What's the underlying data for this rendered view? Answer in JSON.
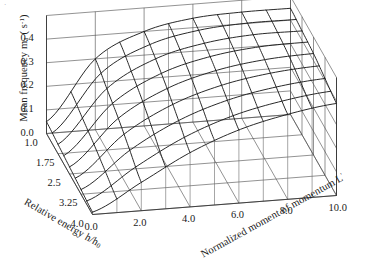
{
  "figure": {
    "type": "3d-surface-wireframe",
    "background": "#ffffff",
    "line_color": "#2b2b2b",
    "grid_color": "#4a4a4a"
  },
  "axes": {
    "z": {
      "label_prefix": "Mean frequency m",
      "label_sub": "1",
      "label_mid": " ( s",
      "label_sup": "-1",
      "label_suffix": ")",
      "full_label": "Mean frequency m1 ( s-1)",
      "ticks": [
        "0.0",
        "0.1",
        "0.2",
        "0.3",
        "0.4"
      ],
      "values": [
        0.0,
        0.1,
        0.2,
        0.3,
        0.4
      ],
      "range": [
        0.0,
        0.5
      ]
    },
    "x": {
      "label_prefix": "Relative energy h/h",
      "label_sub": "0",
      "full_label": "Relative energy h/h0",
      "ticks": [
        "1.0",
        "1.75",
        "2.5",
        "3.25",
        "4.0"
      ],
      "values": [
        1.0,
        1.75,
        2.5,
        3.25,
        4.0
      ],
      "range": [
        1.0,
        4.0
      ]
    },
    "y": {
      "label_prefix": "Normalized moment of momentum L",
      "label_sup": "'",
      "full_label": "Normalized moment of momentum L'",
      "ticks": [
        "0.0",
        "2.0",
        "4.0",
        "6.0",
        "8.0",
        "10.0"
      ],
      "values": [
        0.0,
        2.0,
        4.0,
        6.0,
        8.0,
        10.0
      ],
      "range": [
        0.0,
        10.0
      ]
    }
  },
  "chart_data": {
    "type": "surface",
    "title": "",
    "xlabel": "Relative energy h/h0",
    "ylabel": "Normalized moment of momentum L'",
    "zlabel": "Mean frequency m1 ( s-1)",
    "xlim": [
      1.0,
      4.0
    ],
    "ylim": [
      0.0,
      10.0
    ],
    "zlim": [
      0.0,
      0.5
    ],
    "grid": true,
    "legend": "none",
    "x": [
      1.0,
      1.75,
      2.5,
      3.25,
      4.0
    ],
    "y": [
      0.0,
      2.0,
      4.0,
      6.0,
      8.0,
      10.0
    ],
    "z_rows_note": "rows indexed by x (Relative energy h/h0), columns by y (Normalized moment of momentum L')",
    "z": [
      [
        0.05,
        0.3,
        0.4,
        0.44,
        0.45,
        0.45
      ],
      [
        0.04,
        0.26,
        0.37,
        0.42,
        0.44,
        0.44
      ],
      [
        0.03,
        0.22,
        0.33,
        0.39,
        0.42,
        0.43
      ],
      [
        0.02,
        0.17,
        0.28,
        0.35,
        0.39,
        0.41
      ],
      [
        0.01,
        0.12,
        0.23,
        0.31,
        0.36,
        0.39
      ]
    ]
  },
  "artifacts": {
    "speck": "·"
  }
}
